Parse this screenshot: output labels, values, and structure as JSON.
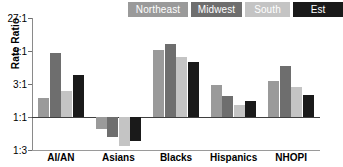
{
  "chart_data": {
    "type": "bar",
    "title": "",
    "xlabel": "",
    "ylabel": "Rate Ratio",
    "scale": "log",
    "reference_line": 1,
    "grid": false,
    "legend_position": "top-right",
    "categories": [
      "AI/AN",
      "Asians",
      "Blacks",
      "Hispanics",
      "NHOPI"
    ],
    "ytick_labels": [
      "27:1",
      "9:1",
      "3:1",
      "1:1",
      "1:3"
    ],
    "ytick_values": [
      27,
      9,
      3,
      1,
      0.3333
    ],
    "ylim": [
      0.3333,
      27
    ],
    "series": [
      {
        "name": "Northeast",
        "color": "#9a9a9a",
        "values": [
          1.9,
          0.66,
          9.3,
          2.9,
          3.3
        ]
      },
      {
        "name": "Midwest",
        "color": "#6e6e6e",
        "values": [
          8.3,
          0.52,
          11.5,
          2.0,
          5.4
        ]
      },
      {
        "name": "South",
        "color": "#c4c4c4",
        "values": [
          2.4,
          0.38,
          7.3,
          1.5,
          2.7
        ]
      },
      {
        "name": "Est",
        "color": "#1a1a1a",
        "values": [
          4.0,
          0.45,
          6.2,
          1.7,
          2.1
        ]
      }
    ]
  },
  "legend": {
    "items": [
      {
        "label": "Northeast",
        "color": "#9a9a9a",
        "text_color": "#ffffff"
      },
      {
        "label": "Midwest",
        "color": "#6e6e6e",
        "text_color": "#ffffff"
      },
      {
        "label": "South",
        "color": "#c4c4c4",
        "text_color": "#ffffff"
      },
      {
        "label": "Est",
        "color": "#1a1a1a",
        "text_color": "#ffffff"
      }
    ]
  },
  "axes": {
    "y_title": "Rate Ratio"
  },
  "colors": {
    "axis": "#8a8a8a",
    "baseline": "#3f3f3f",
    "background": "#ffffff",
    "text": "#000000"
  }
}
